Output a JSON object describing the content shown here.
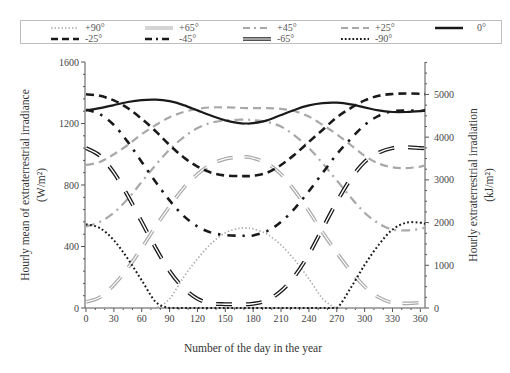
{
  "chart_data": {
    "type": "line",
    "title": "",
    "xlabel": "Number of the day in the year",
    "ylabel": "Hourly mean of extraterrestrial irradiance (W/m²)",
    "ylabel_line1": "Hourly mean of extraterrestrial irradiance",
    "ylabel_line2": "(W/m²)",
    "y2label": "Hourly extraterrestrial irradiation (kJ/m²)",
    "y2label_line1": "Hourly extraterrestrial irradiation",
    "y2label_line2": "(kJ/m²)",
    "xlim": [
      0,
      365
    ],
    "ylim": [
      0,
      1600
    ],
    "y2lim": [
      0,
      5760
    ],
    "grid": false,
    "legend_position": "top",
    "x_ticks": [
      "0",
      "30",
      "60",
      "90",
      "120",
      "150",
      "180",
      "210",
      "240",
      "270",
      "300",
      "330",
      "360"
    ],
    "y_ticks": [
      "0",
      "400",
      "800",
      "1200",
      "1600"
    ],
    "y2_ticks": [
      "0",
      "1000",
      "2000",
      "3000",
      "4000",
      "5000"
    ],
    "x": [
      0,
      15,
      30,
      45,
      60,
      75,
      90,
      105,
      120,
      135,
      150,
      165,
      172,
      180,
      195,
      210,
      225,
      240,
      255,
      270,
      285,
      300,
      315,
      330,
      345,
      360,
      365
    ],
    "series": [
      {
        "name": "+90°",
        "style": "dotted-light",
        "values": [
          0,
          0,
          0,
          0,
          0,
          0,
          60,
          200,
          320,
          420,
          490,
          518,
          520,
          515,
          480,
          410,
          310,
          190,
          60,
          0,
          0,
          0,
          0,
          0,
          0,
          0,
          0
        ]
      },
      {
        "name": "+65°",
        "style": "double-light",
        "values": [
          40,
          70,
          150,
          260,
          390,
          530,
          660,
          780,
          870,
          935,
          970,
          982,
          983,
          975,
          940,
          870,
          760,
          630,
          490,
          360,
          240,
          140,
          70,
          35,
          30,
          35,
          40
        ]
      },
      {
        "name": "+45°",
        "style": "dashdot-light",
        "values": [
          530,
          560,
          620,
          710,
          820,
          930,
          1030,
          1110,
          1170,
          1205,
          1220,
          1225,
          1225,
          1222,
          1210,
          1180,
          1120,
          1040,
          940,
          830,
          720,
          620,
          550,
          510,
          505,
          515,
          525
        ]
      },
      {
        "name": "+25°",
        "style": "dashed-light",
        "values": [
          930,
          950,
          1000,
          1060,
          1130,
          1190,
          1240,
          1275,
          1295,
          1305,
          1305,
          1302,
          1300,
          1300,
          1300,
          1295,
          1280,
          1245,
          1190,
          1130,
          1060,
          990,
          940,
          915,
          910,
          920,
          928
        ]
      },
      {
        "name": "0°",
        "style": "solid-dark",
        "values": [
          1285,
          1300,
          1320,
          1340,
          1352,
          1355,
          1345,
          1320,
          1285,
          1250,
          1220,
          1202,
          1200,
          1202,
          1220,
          1255,
          1290,
          1318,
          1333,
          1335,
          1325,
          1305,
          1285,
          1275,
          1275,
          1280,
          1283
        ]
      },
      {
        "name": "-25°",
        "style": "dashed-dark",
        "values": [
          1390,
          1380,
          1350,
          1300,
          1230,
          1150,
          1060,
          980,
          920,
          880,
          862,
          858,
          858,
          860,
          880,
          930,
          1000,
          1080,
          1160,
          1240,
          1300,
          1350,
          1380,
          1392,
          1395,
          1393,
          1391
        ]
      },
      {
        "name": "-45°",
        "style": "dashdot-dark",
        "values": [
          1290,
          1260,
          1190,
          1080,
          950,
          820,
          700,
          600,
          530,
          490,
          475,
          470,
          470,
          472,
          500,
          560,
          650,
          760,
          880,
          1000,
          1100,
          1190,
          1250,
          1280,
          1285,
          1282,
          1288
        ]
      },
      {
        "name": "-65°",
        "style": "double-dark",
        "values": [
          1040,
          990,
          880,
          730,
          560,
          390,
          240,
          130,
          60,
          30,
          25,
          25,
          25,
          27,
          50,
          110,
          210,
          350,
          520,
          690,
          840,
          950,
          1010,
          1040,
          1045,
          1040,
          1040
        ]
      },
      {
        "name": "-90°",
        "style": "dotted-dark",
        "values": [
          545,
          520,
          440,
          320,
          180,
          40,
          0,
          0,
          0,
          0,
          0,
          0,
          0,
          0,
          0,
          0,
          0,
          0,
          0,
          0,
          130,
          280,
          410,
          510,
          555,
          555,
          548
        ]
      }
    ]
  },
  "legend": {
    "items": [
      {
        "label": "+90°"
      },
      {
        "label": "+65°"
      },
      {
        "label": "+45°"
      },
      {
        "label": "+25°"
      },
      {
        "label": "0°"
      },
      {
        "label": "-25°"
      },
      {
        "label": "-45°"
      },
      {
        "label": "-65°"
      },
      {
        "label": "-90°"
      }
    ]
  },
  "colors": {
    "dark": "#1a1a1a",
    "light": "#a8a8a8",
    "axis": "#555555"
  }
}
